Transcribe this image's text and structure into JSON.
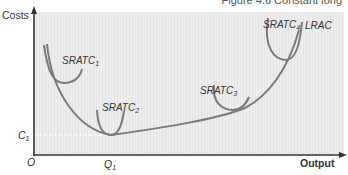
{
  "header": {
    "caption": "Figure 4.6 Constant long"
  },
  "chart": {
    "type": "diagram",
    "y_axis_label": "Costs",
    "x_axis_label": "Output",
    "origin_label": "O",
    "y_marker_label": "C",
    "y_marker_sub": "1",
    "x_marker_label": "Q",
    "x_marker_sub": "1",
    "curves": [
      {
        "name": "SRATC",
        "sub": "1"
      },
      {
        "name": "SRATC",
        "sub": "2"
      },
      {
        "name": "SRATC",
        "sub": "3"
      },
      {
        "name": "SRATC",
        "sub": "4"
      },
      {
        "name": "LRAC",
        "sub": ""
      }
    ],
    "colors": {
      "plot_bg": "#ececec",
      "curve": "#7a7a7a",
      "axis": "#333333",
      "dashed": "#ffffff"
    }
  }
}
